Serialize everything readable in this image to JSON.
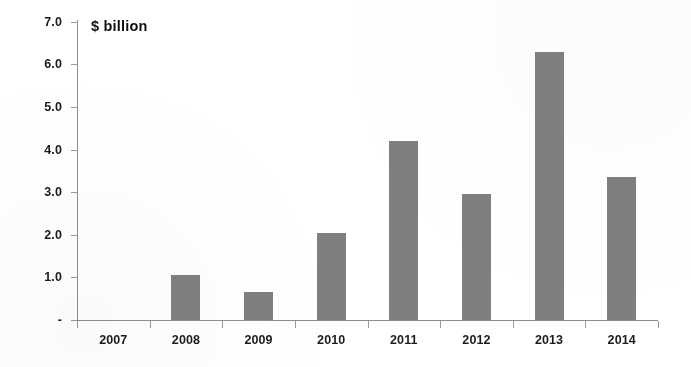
{
  "chart_data": {
    "type": "bar",
    "title": "$ billion",
    "xlabel": "",
    "ylabel": "$ billion",
    "categories": [
      "2007",
      "2008",
      "2009",
      "2010",
      "2011",
      "2012",
      "2013",
      "2014"
    ],
    "values": [
      0,
      1.05,
      0.65,
      2.05,
      4.2,
      2.95,
      6.3,
      3.35
    ],
    "ylim": [
      0,
      7.0
    ],
    "ytick_values": [
      0,
      1.0,
      2.0,
      3.0,
      4.0,
      5.0,
      6.0,
      7.0
    ],
    "ytick_labels": [
      "-",
      "1.0",
      "2.0",
      "3.0",
      "4.0",
      "5.0",
      "6.0",
      "7.0"
    ],
    "grid": false,
    "legend": null,
    "series": [
      {
        "name": "$ billion",
        "color": "#7f7f7f",
        "values": [
          0,
          1.05,
          0.65,
          2.05,
          4.2,
          2.95,
          6.3,
          3.35
        ]
      }
    ],
    "colors": {
      "bar": "#7f7f7f",
      "axis": "#8e8e8e",
      "text": "#1c1c1c",
      "background": "#ffffff"
    }
  }
}
